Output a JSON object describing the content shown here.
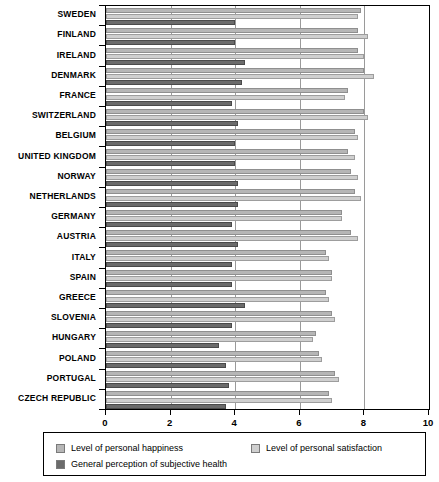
{
  "chart_data": {
    "type": "bar",
    "orientation": "horizontal",
    "title": "",
    "xlabel": "",
    "ylabel": "",
    "xlim": [
      0,
      10
    ],
    "xticks": [
      0,
      2,
      4,
      6,
      8,
      10
    ],
    "gridlines": [
      2,
      4,
      6,
      8
    ],
    "grid": true,
    "legend_position": "bottom",
    "categories": [
      "SWEDEN",
      "FINLAND",
      "IRELAND",
      "DENMARK",
      "FRANCE",
      "SWITZERLAND",
      "BELGIUM",
      "UNITED KINGDOM",
      "NORWAY",
      "NETHERLANDS",
      "GERMANY",
      "AUSTRIA",
      "ITALY",
      "SPAIN",
      "GREECE",
      "SLOVENIA",
      "HUNGARY",
      "POLAND",
      "PORTUGAL",
      "CZECH REPUBLIC"
    ],
    "series": [
      {
        "name": "Level of personal happiness",
        "color": "#b6b6b6",
        "values": [
          7.9,
          7.8,
          7.8,
          8.0,
          7.5,
          8.0,
          7.7,
          7.5,
          7.6,
          7.7,
          7.3,
          7.6,
          6.8,
          7.0,
          6.8,
          7.0,
          6.5,
          6.6,
          7.1,
          6.9
        ]
      },
      {
        "name": "Level of personal satisfaction",
        "color": "#cfcfcf",
        "values": [
          7.8,
          8.1,
          8.0,
          8.3,
          7.4,
          8.1,
          7.8,
          7.7,
          7.8,
          7.9,
          7.3,
          7.8,
          6.9,
          7.0,
          6.9,
          7.1,
          6.4,
          6.7,
          7.2,
          7.0
        ]
      },
      {
        "name": "General perception of subjective health",
        "color": "#6b6b6b",
        "values": [
          4.0,
          4.0,
          4.3,
          4.2,
          3.9,
          4.1,
          4.0,
          4.0,
          4.1,
          4.1,
          3.9,
          4.1,
          3.9,
          3.9,
          4.3,
          3.9,
          3.5,
          3.7,
          3.8,
          3.7
        ]
      }
    ]
  },
  "legend": {
    "items": [
      {
        "label": "Level of personal happiness"
      },
      {
        "label": "Level of personal satisfaction"
      },
      {
        "label": "General perception of subjective health"
      }
    ]
  },
  "axis": {
    "tick_labels": [
      "0",
      "2",
      "4",
      "6",
      "8",
      "10"
    ]
  }
}
